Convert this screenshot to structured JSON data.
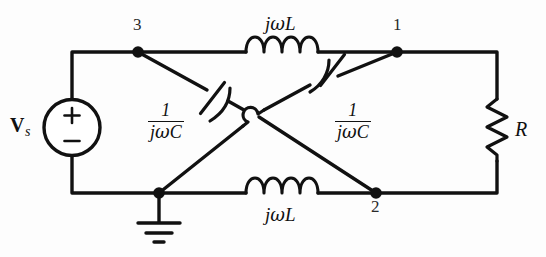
{
  "figure": {
    "kind": "circuit-schematic",
    "stroke_color": "#111111",
    "background_color": "#fdfdfd"
  },
  "source": {
    "name": "voltage-source",
    "label_v": "V",
    "label_sub": "s",
    "polarity_plus": "+",
    "polarity_minus": "−"
  },
  "nodes": [
    {
      "id": "node-3",
      "label": "3",
      "position": "top-left"
    },
    {
      "id": "node-1",
      "label": "1",
      "position": "top-right"
    },
    {
      "id": "node-2",
      "label": "2",
      "position": "bottom-right"
    },
    {
      "id": "node-ground",
      "label": "",
      "position": "bottom-left"
    }
  ],
  "components": {
    "inductor_top": {
      "name": "inductor-top",
      "label_j": "j",
      "label_omega": "ω",
      "label_l": "L",
      "label_full": "jωL",
      "coils": 4,
      "between": [
        "3",
        "1"
      ]
    },
    "inductor_bottom": {
      "name": "inductor-bottom",
      "label_j": "j",
      "label_omega": "ω",
      "label_l": "L",
      "label_full": "jωL",
      "coils": 4,
      "between": [
        "ground",
        "2"
      ]
    },
    "capacitor_left": {
      "name": "capacitor-left",
      "numerator": "1",
      "denominator_j": "j",
      "denominator_omega": "ω",
      "denominator_c": "C",
      "label_full": "1/(jωC)",
      "between": [
        "3",
        "2"
      ]
    },
    "capacitor_right": {
      "name": "capacitor-right",
      "numerator": "1",
      "denominator_j": "j",
      "denominator_omega": "ω",
      "denominator_c": "C",
      "label_full": "1/(jωC)",
      "between": [
        "ground",
        "1"
      ]
    },
    "resistor": {
      "name": "resistor-load",
      "label": "R",
      "between": [
        "1",
        "2"
      ]
    },
    "ground": {
      "name": "ground-symbol",
      "bars": 3
    },
    "wire_hop": {
      "name": "wire-crossing-hop",
      "meaning": "no connection"
    }
  }
}
